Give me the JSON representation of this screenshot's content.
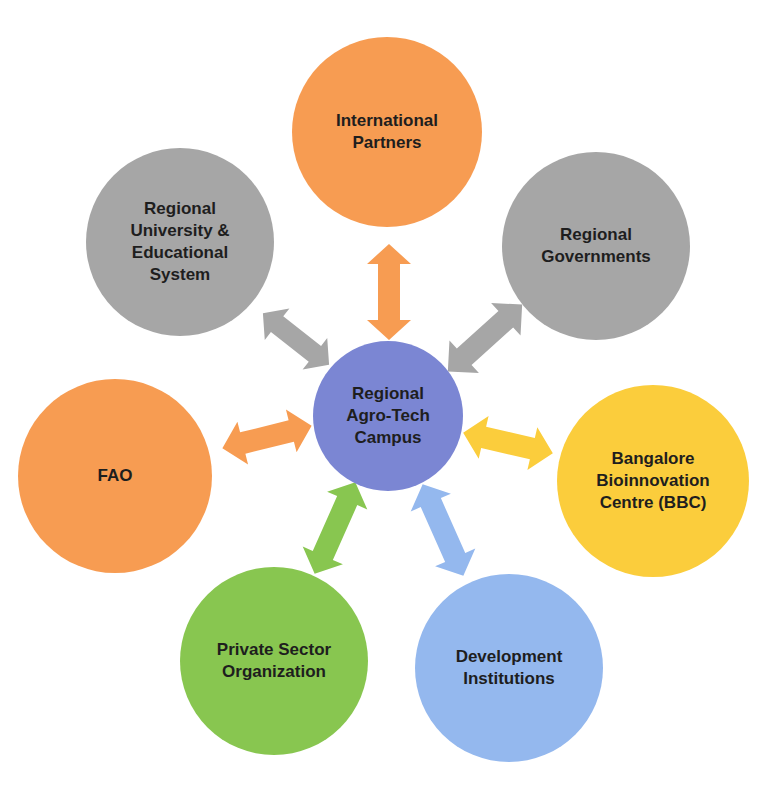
{
  "diagram": {
    "type": "hub-and-spoke",
    "center": {
      "label_lines": [
        "Regional",
        "Agro-Tech",
        "Campus"
      ],
      "color": "#7b86d3"
    },
    "nodes": [
      {
        "id": "international-partners",
        "label_lines": [
          "International",
          "Partners"
        ],
        "color": "#f79c52",
        "arrow_color": "#f79c52"
      },
      {
        "id": "regional-university",
        "label_lines": [
          "Regional",
          "University &",
          "Educational",
          "System"
        ],
        "color": "#a6a6a6",
        "arrow_color": "#a6a6a6"
      },
      {
        "id": "regional-governments",
        "label_lines": [
          "Regional",
          "Governments"
        ],
        "color": "#a6a6a6",
        "arrow_color": "#a6a6a6"
      },
      {
        "id": "fao",
        "label_lines": [
          "FAO"
        ],
        "color": "#f79c52",
        "arrow_color": "#f79c52"
      },
      {
        "id": "bbc",
        "label_lines": [
          "Bangalore",
          "Bioinnovation",
          "Centre (BBC)"
        ],
        "color": "#fbcd3c",
        "arrow_color": "#fbcd3c"
      },
      {
        "id": "private-sector",
        "label_lines": [
          "Private Sector",
          "Organization"
        ],
        "color": "#88c650",
        "arrow_color": "#88c650"
      },
      {
        "id": "development-institutions",
        "label_lines": [
          "Development",
          "Institutions"
        ],
        "color": "#94b8ee",
        "arrow_color": "#94b8ee"
      }
    ],
    "edges": "bidirectional arrows between center and each node"
  },
  "labels": {
    "center": "Regional\nAgro-Tech\nCampus",
    "international_partners": "International\nPartners",
    "regional_university": "Regional\nUniversity &\nEducational\nSystem",
    "regional_governments": "Regional\nGovernments",
    "fao": "FAO",
    "bbc": "Bangalore\nBioinnovation\nCentre (BBC)",
    "private_sector": "Private Sector\nOrganization",
    "development_institutions": "Development\nInstitutions"
  }
}
